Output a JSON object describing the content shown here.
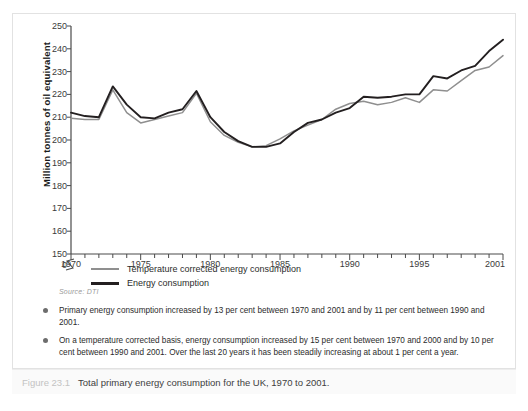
{
  "figure": {
    "caption_number": "Figure 23.1",
    "caption_text": "Total primary energy consumption for the UK, 1970 to 2001.",
    "source": "Source: DTI"
  },
  "legend": {
    "items": [
      {
        "label": "Temperature corrected energy consumption",
        "color": "#8f8f8f",
        "key": "temperature_corrected"
      },
      {
        "label": "Energy consumption",
        "color": "#231f20",
        "key": "energy_consumption"
      }
    ]
  },
  "notes": [
    "Primary energy consumption increased by 13 per cent between 1970 and 2001 and by 11 per cent between 1990 and 2001.",
    "On a temperature corrected basis, energy consumption increased by 15 per cent between 1970 and 2000 and by 10 per cent between 1990 and 2001. Over the last 20 years it has been steadily increasing at about 1 per cent a year."
  ],
  "chart_data": {
    "type": "line",
    "title": "",
    "xlabel": "",
    "ylabel": "Million tonnes of oil equivalent",
    "x": [
      1970,
      1971,
      1972,
      1973,
      1974,
      1975,
      1976,
      1977,
      1978,
      1979,
      1980,
      1981,
      1982,
      1983,
      1984,
      1985,
      1986,
      1987,
      1988,
      1989,
      1990,
      1991,
      1992,
      1993,
      1994,
      1995,
      1996,
      1997,
      1998,
      1999,
      2000,
      2001
    ],
    "xlim": [
      1970,
      2001
    ],
    "ylim": [
      150,
      250
    ],
    "yticks": [
      150,
      160,
      170,
      180,
      190,
      200,
      210,
      220,
      230,
      240,
      250
    ],
    "xticks": [
      1970,
      1975,
      1980,
      1985,
      1990,
      1995,
      2001
    ],
    "xtick_labels": [
      "1970",
      "1975",
      "1980",
      "1985",
      "1990",
      "1995",
      "2001"
    ],
    "axis_break": true,
    "axis_break_label": "0",
    "grid": false,
    "legend_position": "below",
    "series": [
      {
        "name": "Energy consumption",
        "color": "#231f20",
        "values": [
          212,
          210.5,
          210,
          223.5,
          215.5,
          210,
          209.5,
          212,
          213.5,
          221.5,
          210,
          203.5,
          199.5,
          197,
          197,
          198.5,
          203.5,
          207.5,
          209,
          212,
          214,
          219,
          218.5,
          219,
          220,
          220,
          228,
          227,
          230.5,
          232.5,
          239,
          244
        ]
      },
      {
        "name": "Temperature corrected energy consumption",
        "color": "#8f8f8f",
        "values": [
          209.5,
          209,
          209,
          222,
          212,
          207.5,
          209,
          210.5,
          212,
          220.5,
          208,
          202,
          199,
          197,
          197.5,
          200.5,
          204,
          206.5,
          209,
          213.5,
          216,
          217,
          215.5,
          216.5,
          218.5,
          216.5,
          222,
          221.5,
          226,
          230.5,
          232,
          237
        ]
      }
    ]
  }
}
